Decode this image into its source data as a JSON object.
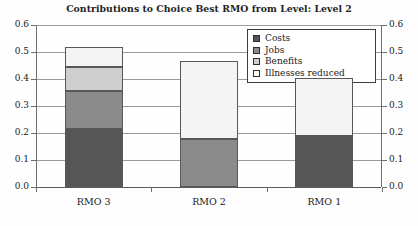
{
  "chart_data": {
    "type": "bar",
    "subtype": "stacked-bar",
    "title": "Contributions to Choice Best RMO from Level: Level 2",
    "xlabel": "",
    "ylabel": "",
    "categories": [
      "RMO 3",
      "RMO 2",
      "RMO 1"
    ],
    "ylim": [
      0.0,
      0.6
    ],
    "ytick_labels": [
      "0.0",
      "0.1",
      "0.2",
      "0.3",
      "0.4",
      "0.5",
      "0.6"
    ],
    "ytick_values": [
      0.0,
      0.1,
      0.2,
      0.3,
      0.4,
      0.5,
      0.6
    ],
    "right_axis_labels": [
      "0.0",
      "0.1",
      "0.2",
      "0.3",
      "0.4",
      "0.5",
      "0.6"
    ],
    "grid": true,
    "grid_axis": "y",
    "legend_position": "top-right",
    "series": [
      {
        "name": "Costs",
        "color": "#565656",
        "values": [
          0.215,
          0.0,
          0.19
        ]
      },
      {
        "name": "Jobs",
        "color": "#8b8b8b",
        "values": [
          0.14,
          0.178,
          0.0
        ]
      },
      {
        "name": "Benefits",
        "color": "#cfcfcf",
        "values": [
          0.09,
          0.0,
          0.0
        ]
      },
      {
        "name": "Illnesses reduced",
        "color": "#f4f4f4",
        "values": [
          0.072,
          0.289,
          0.213
        ]
      }
    ],
    "totals": [
      0.517,
      0.467,
      0.403
    ],
    "annotations": []
  },
  "legend": {
    "items": [
      {
        "label": "Costs",
        "swatch": "#565656"
      },
      {
        "label": "Jobs",
        "swatch": "#8b8b8b"
      },
      {
        "label": "Benefits",
        "swatch": "#cfcfcf"
      },
      {
        "label": "Illnesses reduced",
        "swatch": "#fdfdfd"
      }
    ]
  }
}
